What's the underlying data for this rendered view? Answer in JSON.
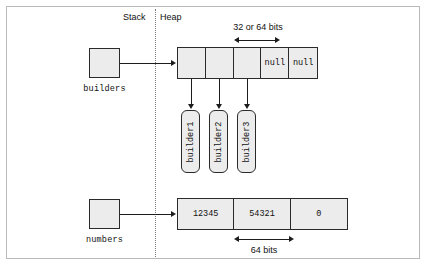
{
  "figure": {
    "regions": {
      "stack_label": "Stack",
      "heap_label": "Heap"
    }
  },
  "stack_variables": [
    {
      "name": "builders",
      "label": "builders"
    },
    {
      "name": "numbers",
      "label": "numbers"
    }
  ],
  "builders_array": {
    "annotation": "32 or 64 bits",
    "cells": [
      {
        "value": "",
        "kind": "reference"
      },
      {
        "value": "",
        "kind": "reference"
      },
      {
        "value": "",
        "kind": "reference"
      },
      {
        "value": "null",
        "kind": "null"
      },
      {
        "value": "null",
        "kind": "null"
      }
    ]
  },
  "heap_objects": [
    {
      "label": "builder1"
    },
    {
      "label": "builder2"
    },
    {
      "label": "builder3"
    }
  ],
  "numbers_array": {
    "annotation": "64 bits",
    "cells": [
      {
        "value": "12345"
      },
      {
        "value": "54321"
      },
      {
        "value": "0"
      }
    ]
  },
  "colors": {
    "fill": "#ececec",
    "stroke": "#2a2a2a",
    "line": "#1c1c1c",
    "frame": "#b9b9b9",
    "divider": "#7d7d7d",
    "text": "#111111"
  }
}
